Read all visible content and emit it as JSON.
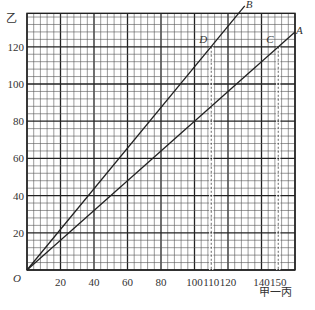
{
  "chart_data": {
    "type": "line",
    "title": "",
    "xlabel": "甲一丙",
    "ylabel": "乙",
    "origin_label": "O",
    "xlim": [
      0,
      160
    ],
    "ylim": [
      0,
      138
    ],
    "x_ticks": [
      20,
      40,
      60,
      80,
      100,
      110,
      120,
      140,
      150
    ],
    "y_ticks": [
      20,
      40,
      60,
      80,
      100,
      120
    ],
    "grid": {
      "minor_step": 4,
      "major_step": 20
    },
    "series": [
      {
        "name": "B",
        "points": [
          [
            0,
            0
          ],
          [
            110,
            120
          ],
          [
            130,
            142
          ]
        ],
        "color": "#222222"
      },
      {
        "name": "A",
        "points": [
          [
            0,
            0
          ],
          [
            150,
            120
          ],
          [
            160,
            128
          ]
        ],
        "color": "#222222"
      }
    ],
    "annotations": [
      {
        "label": "D",
        "x": 110,
        "y": 120,
        "dropline": "dashed"
      },
      {
        "label": "C",
        "x": 150,
        "y": 120,
        "dropline": "dashed"
      }
    ]
  },
  "colors": {
    "grid_major": "#222222",
    "grid_minor": "#555555",
    "line": "#222222"
  }
}
